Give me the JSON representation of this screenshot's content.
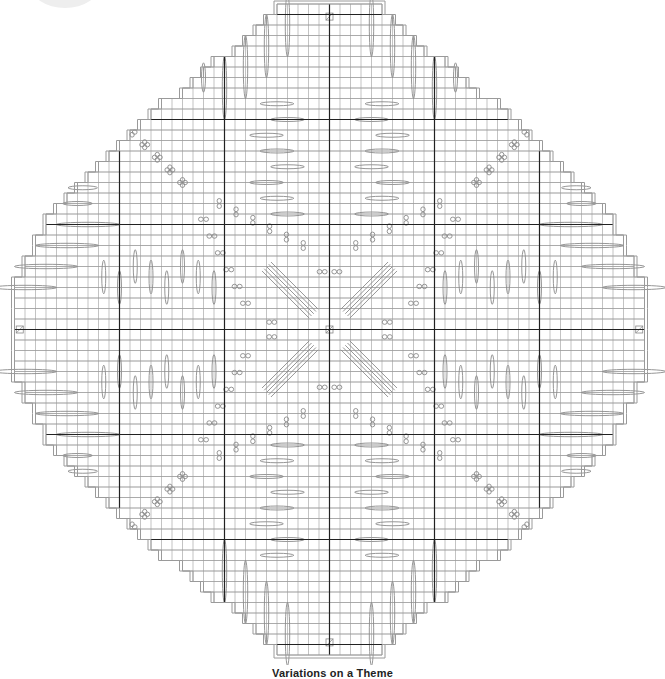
{
  "title": "Variations on a Theme",
  "colors": {
    "grid": "#9a9a9a",
    "heavy": "#222222",
    "outline": "#9a9a9a",
    "symbol": "#8a8a8a",
    "background": "#ffffff"
  },
  "grid": {
    "cell": 10.5,
    "origin_x": 4,
    "origin_y": 4,
    "cols": 62,
    "rows": 62,
    "center_col": 30.5,
    "center_row": 31.5,
    "heavy_every": 10,
    "heavy_cols": [
      10,
      20,
      30,
      40,
      50
    ],
    "heavy_rows": [
      3,
      13,
      23,
      33,
      43,
      53
    ]
  },
  "outline_half_widths_by_row_from_center": [
    30,
    30,
    30,
    30,
    30,
    29,
    29,
    28,
    28,
    27,
    27,
    26,
    25,
    24,
    23,
    22,
    21,
    20,
    19,
    18,
    17,
    16,
    14,
    13,
    12,
    11,
    9,
    8,
    7,
    6,
    5
  ],
  "legend_symbols": [
    {
      "name": "long-stitch-ellipse",
      "meaning": "elongated stitch"
    },
    {
      "name": "double-oval",
      "meaning": "paired small stitches"
    },
    {
      "name": "diagonal-bundle",
      "meaning": "diagonal long stitches"
    },
    {
      "name": "n-box",
      "meaning": "anchor stitch"
    }
  ]
}
